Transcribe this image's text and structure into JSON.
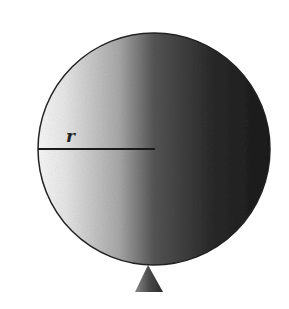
{
  "figure": {
    "radius_label": "r",
    "colors": {
      "background": "#ffffff",
      "sphere_light": "#f4f4f4",
      "sphere_mid": "#9a9a9a",
      "sphere_dark": "#1e1e1e",
      "line": "#1a1a1a",
      "support": "#4a4a4a"
    }
  }
}
